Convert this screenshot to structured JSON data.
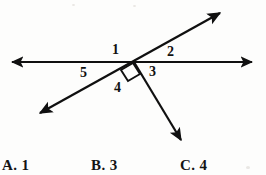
{
  "figure": {
    "stroke_color": "#101010",
    "background_color": "#fdfdfc",
    "angle_labels": [
      {
        "id": "1",
        "text": "1",
        "x": 116,
        "y": 50,
        "region": "above-left-of-intersection"
      },
      {
        "id": "2",
        "text": "2",
        "x": 171,
        "y": 52,
        "region": "above-right-of-intersection"
      },
      {
        "id": "3",
        "text": "3",
        "x": 153,
        "y": 72,
        "region": "below-right-of-intersection"
      },
      {
        "id": "4",
        "text": "4",
        "x": 118,
        "y": 88,
        "region": "below-of-intersection"
      },
      {
        "id": "5",
        "text": "5",
        "x": 85,
        "y": 73,
        "region": "below-left-of-intersection"
      }
    ],
    "intersection_point": {
      "x": 134,
      "y": 62
    },
    "right_angle_marker": {
      "present": true,
      "between_angles": [
        "4",
        "3"
      ]
    },
    "lines": [
      {
        "name": "horizontal-line",
        "from": {
          "x": 8,
          "y": 62
        },
        "to": {
          "x": 258,
          "y": 62
        },
        "arrow_start": true,
        "arrow_end": true
      },
      {
        "name": "diagonal-line",
        "from": {
          "x": 34,
          "y": 117
        },
        "to": {
          "x": 226,
          "y": 8
        },
        "arrow_start": true,
        "arrow_end": true
      },
      {
        "name": "descending-ray",
        "from": {
          "x": 134,
          "y": 62
        },
        "to": {
          "x": 186,
          "y": 149
        },
        "arrow_start": false,
        "arrow_end": true
      }
    ]
  },
  "choices": [
    {
      "key": "A",
      "text": "A. 1",
      "value": "1"
    },
    {
      "key": "B",
      "text": "B. 3",
      "value": "3"
    },
    {
      "key": "C",
      "text": "C. 4",
      "value": "4"
    }
  ]
}
